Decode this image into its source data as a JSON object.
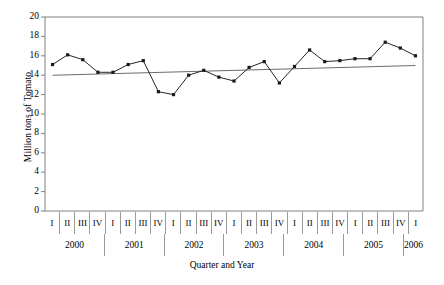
{
  "chart_data": {
    "type": "line",
    "title": "",
    "xlabel": "Quarter and Year",
    "ylabel": "Million tons of Tomato",
    "ylim": [
      0,
      20
    ],
    "yticks": [
      0,
      2,
      4,
      6,
      8,
      10,
      12,
      14,
      16,
      18,
      20
    ],
    "grid": false,
    "legend": "none",
    "categories": [
      "I 2000",
      "II 2000",
      "III 2000",
      "IV 2000",
      "I 2001",
      "II 2001",
      "III 2001",
      "IV 2001",
      "I 2002",
      "II 2002",
      "III 2002",
      "IV 2002",
      "I 2003",
      "II 2003",
      "III 2003",
      "IV 2003",
      "I 2004",
      "II 2004",
      "III 2004",
      "IV 2004",
      "I 2005",
      "II 2005",
      "III 2005",
      "IV 2005",
      "I 2006"
    ],
    "series": [
      {
        "name": "Tomato production",
        "marker": "square",
        "values": [
          15.1,
          16.1,
          15.6,
          14.3,
          14.3,
          15.1,
          15.5,
          12.3,
          12.0,
          14.0,
          14.5,
          13.8,
          13.4,
          14.8,
          15.4,
          13.2,
          14.9,
          16.6,
          15.4,
          15.5,
          15.7,
          15.7,
          17.4,
          16.8,
          16.0
        ]
      },
      {
        "name": "Linear trend",
        "marker": "none",
        "values": [
          14.0,
          14.04,
          14.08,
          14.13,
          14.17,
          14.21,
          14.25,
          14.29,
          14.33,
          14.38,
          14.42,
          14.46,
          14.5,
          14.54,
          14.58,
          14.63,
          14.67,
          14.71,
          14.75,
          14.79,
          14.83,
          14.88,
          14.92,
          14.96,
          15.0
        ]
      }
    ],
    "quarter_labels": [
      "I",
      "II",
      "III",
      "IV",
      "I",
      "II",
      "III",
      "IV",
      "I",
      "II",
      "III",
      "IV",
      "I",
      "II",
      "III",
      "IV",
      "I",
      "II",
      "III",
      "IV",
      "I",
      "II",
      "III",
      "IV",
      "I"
    ],
    "year_groups": [
      {
        "label": "2000",
        "span": 4
      },
      {
        "label": "2001",
        "span": 4
      },
      {
        "label": "2002",
        "span": 4
      },
      {
        "label": "2003",
        "span": 4
      },
      {
        "label": "2004",
        "span": 4
      },
      {
        "label": "2005",
        "span": 4
      },
      {
        "label": "2006",
        "span": 1
      }
    ],
    "colors": {
      "series_line": "#262626",
      "trend_line": "#6b6b6b",
      "axis": "#808080",
      "marker": "#1a1a1a",
      "background": "#ffffff"
    }
  }
}
